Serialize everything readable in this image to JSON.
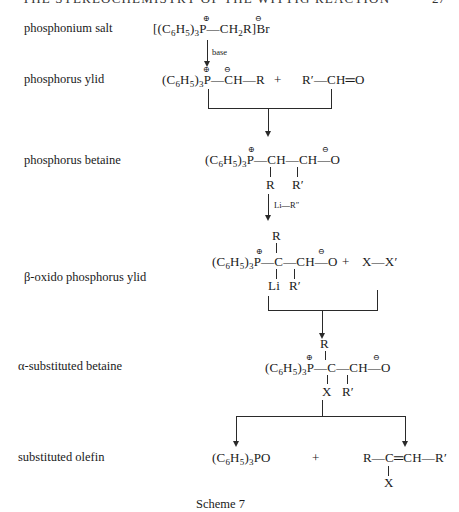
{
  "header": {
    "running_title": "THE STEREOCHEMISTRY OF THE WITTIG REACTION",
    "page_number": "27"
  },
  "rows": [
    {
      "label": "phosphonium salt",
      "formula": {
        "bracket_open": "[(C",
        "c_sub": "6",
        "h": "H",
        "h_sub": "5",
        "close": ")",
        "p_sub": "3",
        "p": "P",
        "p_charge": "⊕",
        "rest": "—CH",
        "ch_sub": "2",
        "r": "R]Br",
        "br_charge": "⊖"
      }
    },
    {
      "label": "phosphorus ylid",
      "formula": {
        "left": "(C",
        "c_sub": "6",
        "h": "H",
        "h_sub": "5",
        "close": ")",
        "p_sub": "3",
        "p": "P",
        "p_charge": "⊕",
        "c_charge": "⊖",
        "rest": "—CH—R",
        "plus": "+",
        "aldehyde": "R′—CH═O"
      }
    },
    {
      "label": "phosphorus betaine",
      "formula": {
        "main": "P—CH—CH—O",
        "p_charge": "⊕",
        "o_charge": "⊖",
        "sub1": "R",
        "sub2": "R′"
      }
    },
    {
      "label": "β-oxido  phosphorus ylid",
      "formula": {
        "top": "R",
        "main": "P—C—CH—O",
        "p_charge": "⊕",
        "o_charge": "⊖",
        "sub1": "Li",
        "sub2": "R′",
        "plus": "+",
        "halogen": "X—X′"
      }
    },
    {
      "label": "α-substituted betaine",
      "formula": {
        "top": "R",
        "main": "P—C—CH—O",
        "p_charge": "⊕",
        "o_charge": "⊖",
        "sub1": "X",
        "sub2": "R′"
      }
    },
    {
      "label": "substituted olefin",
      "formula": {
        "oxide": "PO",
        "plus": "+",
        "olefin": "R—C═CH—R′",
        "sub": "X"
      }
    }
  ],
  "arrows": {
    "base_label": "base",
    "lithium_label": "Li—R″"
  },
  "caption": "Scheme 7"
}
